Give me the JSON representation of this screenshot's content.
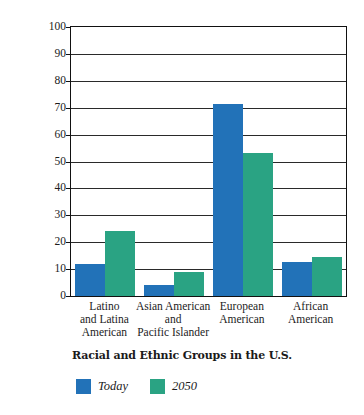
{
  "chart_data": {
    "type": "bar",
    "title": "",
    "xlabel": "Racial and Ethnic Groups in the U.S.",
    "ylabel": "Population (Percent)",
    "ylim": [
      0,
      100
    ],
    "ytick_step": 10,
    "yticks": [
      100,
      90,
      80,
      70,
      60,
      50,
      40,
      30,
      20,
      10,
      0
    ],
    "grid": true,
    "legend_position": "bottom-left",
    "categories": [
      "Latino and Latina American",
      "Asian American and Pacific Islander",
      "European American",
      "African American"
    ],
    "category_lines": [
      [
        "Latino",
        "and Latina",
        "American"
      ],
      [
        "Asian American",
        "and",
        "Pacific Islander"
      ],
      [
        "European",
        "American"
      ],
      [
        "African",
        "American"
      ]
    ],
    "series": [
      {
        "name": "Today",
        "color": "#2272b8",
        "values": [
          12,
          4,
          71.5,
          12.5
        ]
      },
      {
        "name": "2050",
        "color": "#2aa383",
        "values": [
          24,
          9,
          53,
          14.5
        ]
      }
    ]
  },
  "legend": {
    "items": [
      {
        "label": "Today",
        "color": "#2272b8"
      },
      {
        "label": "2050",
        "color": "#2aa383"
      }
    ]
  }
}
